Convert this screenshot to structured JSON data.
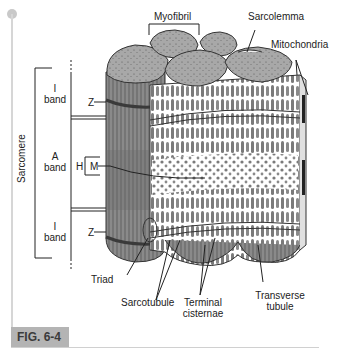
{
  "figure": {
    "label": "FIG. 6-4"
  },
  "labels": {
    "myofibril": "Myofibril",
    "sarcolemma": "Sarcolemma",
    "mitochondria": "Mitochondria",
    "sarcomere": "Sarcomere",
    "i_band_top_1": "I",
    "i_band_top_2": "band",
    "a_band_1": "A",
    "a_band_2": "band",
    "i_band_bottom_1": "I",
    "i_band_bottom_2": "band",
    "z_top": "Z",
    "h": "H",
    "m": "M",
    "z_bottom": "Z",
    "triad": "Triad",
    "sarcotubule": "Sarcotubule",
    "terminal_cisternae_1": "Terminal",
    "terminal_cisternae_2": "cisternae",
    "transverse_tubule_1": "Transverse",
    "transverse_tubule_2": "tubule"
  },
  "colors": {
    "fiber_fill": "#8a8a8a",
    "fiber_dark": "#5e5e5e",
    "myofibril_top": "#a9a9a9",
    "reticulum": "#ffffff",
    "fig_box": "#b4b4b4"
  }
}
